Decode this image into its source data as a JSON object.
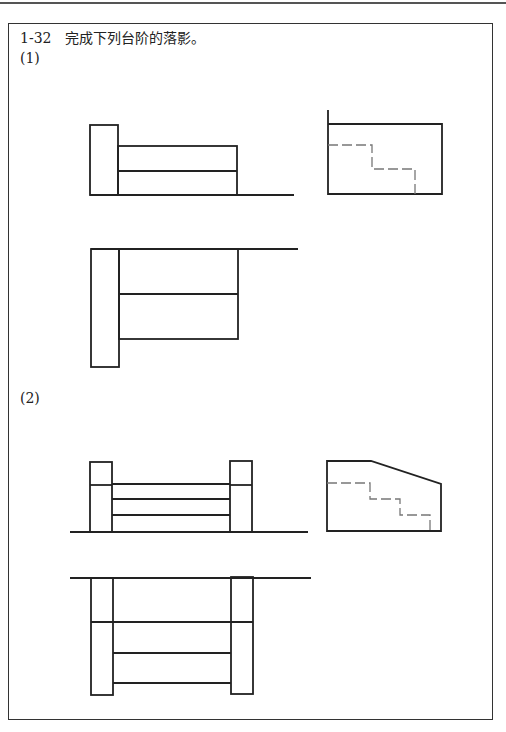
{
  "header": {
    "title": "1-32　完成下列台阶的落影。"
  },
  "parts": [
    {
      "label": "(1)"
    },
    {
      "label": "(2)"
    }
  ],
  "colors": {
    "line": "#222222",
    "dash": "#777777"
  }
}
